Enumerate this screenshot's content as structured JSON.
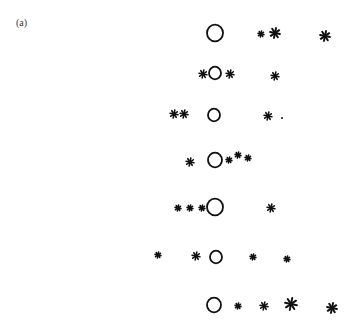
{
  "figure": {
    "panel_label": "(a)",
    "ink_color": "#111111",
    "rows": [
      {
        "circle": {
          "x": 215,
          "y": 33,
          "r": 8
        },
        "stars": [
          {
            "x": 261,
            "y": 34,
            "s": 3
          },
          {
            "x": 275,
            "y": 33,
            "s": 5
          },
          {
            "x": 325,
            "y": 36,
            "s": 5
          }
        ]
      },
      {
        "circle": {
          "x": 215,
          "y": 73,
          "r": 6
        },
        "stars": [
          {
            "x": 203,
            "y": 74,
            "s": 4
          },
          {
            "x": 230,
            "y": 74,
            "s": 4
          },
          {
            "x": 275,
            "y": 76,
            "s": 4
          }
        ]
      },
      {
        "circle": {
          "x": 214,
          "y": 115,
          "r": 6
        },
        "stars": [
          {
            "x": 174,
            "y": 114,
            "s": 4
          },
          {
            "x": 184,
            "y": 114,
            "s": 4
          },
          {
            "x": 268,
            "y": 116,
            "s": 4
          }
        ],
        "dots": [
          {
            "x": 282,
            "y": 118
          }
        ]
      },
      {
        "circle": {
          "x": 215,
          "y": 160,
          "r": 7
        },
        "stars": [
          {
            "x": 190,
            "y": 162,
            "s": 4
          },
          {
            "x": 229,
            "y": 160,
            "s": 3
          },
          {
            "x": 238,
            "y": 155,
            "s": 3
          },
          {
            "x": 248,
            "y": 158,
            "s": 3
          }
        ]
      },
      {
        "circle": {
          "x": 215,
          "y": 207,
          "r": 8
        },
        "stars": [
          {
            "x": 178,
            "y": 208,
            "s": 3
          },
          {
            "x": 190,
            "y": 208,
            "s": 3
          },
          {
            "x": 202,
            "y": 208,
            "s": 3
          },
          {
            "x": 271,
            "y": 208,
            "s": 4
          }
        ]
      },
      {
        "circle": {
          "x": 216,
          "y": 257,
          "r": 6
        },
        "stars": [
          {
            "x": 158,
            "y": 255,
            "s": 3
          },
          {
            "x": 196,
            "y": 256,
            "s": 4
          },
          {
            "x": 253,
            "y": 257,
            "s": 3
          },
          {
            "x": 287,
            "y": 259,
            "s": 3
          }
        ]
      },
      {
        "circle": {
          "x": 214,
          "y": 305,
          "r": 7
        },
        "stars": [
          {
            "x": 238,
            "y": 306,
            "s": 3
          },
          {
            "x": 264,
            "y": 306,
            "s": 4
          },
          {
            "x": 291,
            "y": 304,
            "s": 6
          },
          {
            "x": 332,
            "y": 308,
            "s": 5
          }
        ]
      }
    ]
  }
}
